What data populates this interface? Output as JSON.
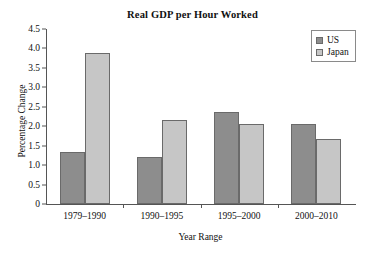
{
  "chart_data": {
    "type": "bar",
    "title": "Real GDP per Hour Worked",
    "xlabel": "Year Range",
    "ylabel": "Percentage Change",
    "categories": [
      "1979–1990",
      "1990–1995",
      "1995–2000",
      "2000–2010"
    ],
    "series": [
      {
        "name": "US",
        "values": [
          1.35,
          1.22,
          2.37,
          2.05
        ],
        "color": "#8d8d8d"
      },
      {
        "name": "Japan",
        "values": [
          3.88,
          2.17,
          2.07,
          1.68
        ],
        "color": "#c6c6c6"
      }
    ],
    "ylim": [
      0,
      4.5
    ],
    "yticks": [
      0,
      0.5,
      1.0,
      1.5,
      2.0,
      2.5,
      3.0,
      3.5,
      4.0,
      4.5
    ],
    "ytick_labels": [
      "0",
      "0.5",
      "1.0",
      "1.5",
      "2.0",
      "2.5",
      "3.0",
      "3.5",
      "4.0",
      "4.5"
    ],
    "grid": false,
    "legend_position": "top-right",
    "legend_entries": [
      "US",
      "Japan"
    ]
  }
}
